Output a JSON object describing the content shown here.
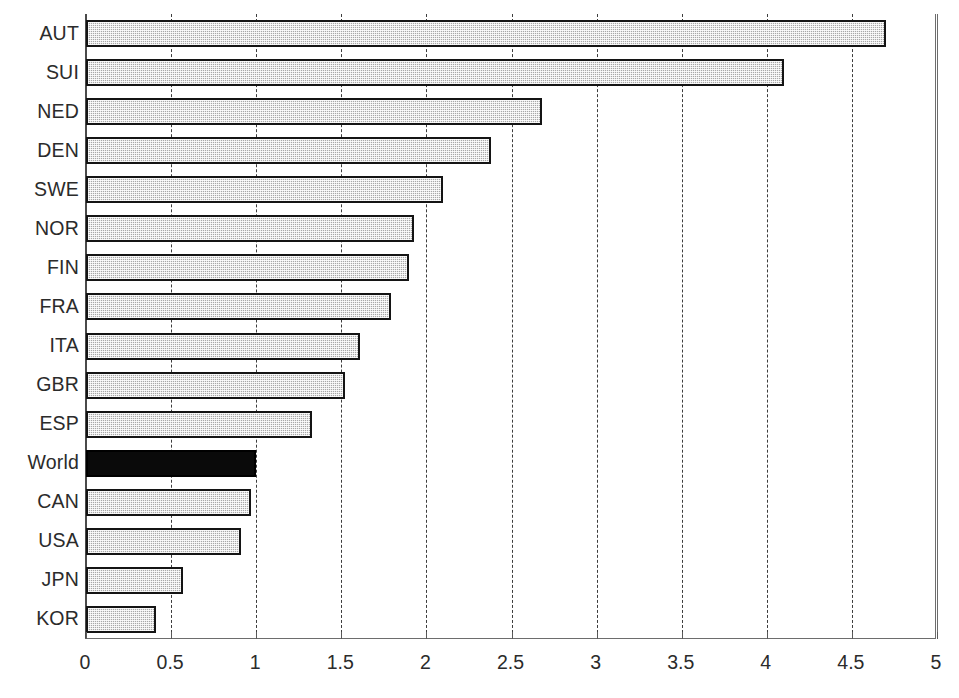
{
  "chart_data": {
    "type": "bar",
    "orientation": "horizontal",
    "title": "",
    "subtitle": "",
    "xlabel": "",
    "ylabel": "",
    "xlim": [
      0,
      5
    ],
    "ylim": null,
    "grid": true,
    "grid_axis": "x",
    "legend": null,
    "legend_position": "none",
    "xticks": [
      "0",
      "0.5",
      "1",
      "1.5",
      "2",
      "2.5",
      "3",
      "3.5",
      "4",
      "4.5",
      "5"
    ],
    "xtick_values": [
      0,
      0.5,
      1,
      1.5,
      2,
      2.5,
      3,
      3.5,
      4,
      4.5,
      5
    ],
    "categories": [
      "AUT",
      "SUI",
      "NED",
      "DEN",
      "SWE",
      "NOR",
      "FIN",
      "FRA",
      "ITA",
      "GBR",
      "ESP",
      "World",
      "CAN",
      "USA",
      "JPN",
      "KOR"
    ],
    "values": [
      4.7,
      4.1,
      2.68,
      2.38,
      2.1,
      1.93,
      1.9,
      1.79,
      1.61,
      1.52,
      1.33,
      1.0,
      0.97,
      0.91,
      0.57,
      0.41
    ],
    "highlight_category": "World",
    "highlight_color": "#0a0a0a",
    "bar_color": "#a8a8a8",
    "bar_edge_color": "#141414",
    "annotations": []
  },
  "axis": {
    "x_min_label": "0",
    "x_max_label": "5"
  }
}
